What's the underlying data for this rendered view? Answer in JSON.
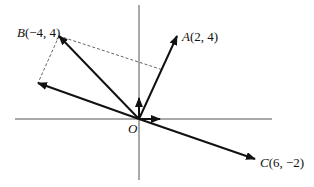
{
  "diagram": {
    "type": "vector-diagram",
    "origin": {
      "label": "O",
      "px": [
        139,
        119
      ]
    },
    "points": {
      "A": {
        "label_letter": "A",
        "label_coords": "(2, 4)",
        "coords": [
          2,
          4
        ],
        "px": [
          177,
          36
        ]
      },
      "B": {
        "label_letter": "B",
        "label_coords": "(−4, 4)",
        "coords": [
          -4,
          4
        ],
        "px": [
          59,
          36
        ]
      },
      "C": {
        "label_letter": "C",
        "label_coords": "(6, −2)",
        "coords": [
          6,
          -2
        ],
        "px": [
          255,
          159
        ]
      },
      "D": {
        "px": [
          38,
          83
        ]
      }
    },
    "vectors": [
      {
        "name": "OA",
        "from": [
          139,
          119
        ],
        "to": [
          177,
          36
        ]
      },
      {
        "name": "OB",
        "from": [
          139,
          119
        ],
        "to": [
          59,
          36
        ]
      },
      {
        "name": "OC",
        "from": [
          139,
          119
        ],
        "to": [
          255,
          159
        ]
      },
      {
        "name": "OD",
        "from": [
          139,
          119
        ],
        "to": [
          38,
          83
        ]
      },
      {
        "name": "unit-j",
        "from": [
          139,
          119
        ],
        "to": [
          139,
          98
        ]
      },
      {
        "name": "unit-i",
        "from": [
          139,
          119
        ],
        "to": [
          160,
          119
        ]
      }
    ],
    "dashed_lines": [
      {
        "name": "B-to-D",
        "from": [
          59,
          36
        ],
        "to": [
          38,
          83
        ]
      },
      {
        "name": "B-to-A-line",
        "from": [
          59,
          36
        ],
        "to": [
          163,
          70
        ]
      }
    ],
    "axes": {
      "x": {
        "from": [
          15,
          119
        ],
        "to": [
          272,
          119
        ]
      },
      "y": {
        "from": [
          139,
          5
        ],
        "to": [
          139,
          180
        ]
      }
    },
    "colors": {
      "stroke": "#111111",
      "axis": "#555555",
      "dash": "#666666"
    }
  }
}
